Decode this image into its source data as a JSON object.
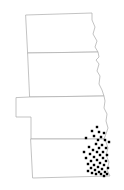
{
  "figure": {
    "type": "point-distribution-map",
    "background_color": "#ffffff",
    "width": 124,
    "height": 190
  },
  "map": {
    "outline_color": "#a9a9a9",
    "outline_width": 0.7,
    "fill_color": "#ffffff",
    "states": [
      {
        "name": "north-dakota",
        "label": "North Dakota",
        "path": "M26,15 L92,13 L92,20 L95,27 L93,34 L97,41 L95,47 L98,52 L28,53 Z"
      },
      {
        "name": "south-dakota",
        "label": "South Dakota",
        "path": "M28,53 L98,52 L99,57 L96,60 L99,64 L97,71 L100,76 L99,84 L102,90 L104,96 L30,97 Z"
      },
      {
        "name": "nebraska",
        "label": "Nebraska",
        "path": "M30,97 L104,96 L105,101 L104,108 L107,114 L106,121 L108,128 L106,134 L104,139 L31,139 L31,117 L16,117 L16,98 Z"
      },
      {
        "name": "kansas",
        "label": "Kansas",
        "path": "M31,139 L104,139 L106,142 L108,148 L106,155 L109,162 L107,170 L110,176 L33,178 Z"
      }
    ]
  },
  "chart_data": {
    "type": "scatter",
    "xlabel": "",
    "ylabel": "",
    "marker_color": "#000000",
    "marker_shape": "square",
    "marker_size": 2.4,
    "point_count": 45,
    "grid": false,
    "legend": "none",
    "xlim": [
      0,
      124
    ],
    "ylim": [
      0,
      190
    ],
    "points": [
      {
        "x": 97,
        "y": 127
      },
      {
        "x": 92,
        "y": 131
      },
      {
        "x": 99,
        "y": 132
      },
      {
        "x": 104,
        "y": 133
      },
      {
        "x": 94,
        "y": 136
      },
      {
        "x": 101,
        "y": 137
      },
      {
        "x": 86,
        "y": 138
      },
      {
        "x": 98,
        "y": 140
      },
      {
        "x": 105,
        "y": 140
      },
      {
        "x": 109,
        "y": 142
      },
      {
        "x": 96,
        "y": 144
      },
      {
        "x": 102,
        "y": 145
      },
      {
        "x": 89,
        "y": 147
      },
      {
        "x": 99,
        "y": 148
      },
      {
        "x": 106,
        "y": 148
      },
      {
        "x": 93,
        "y": 150
      },
      {
        "x": 84,
        "y": 152
      },
      {
        "x": 97,
        "y": 152
      },
      {
        "x": 103,
        "y": 152
      },
      {
        "x": 90,
        "y": 154
      },
      {
        "x": 100,
        "y": 155
      },
      {
        "x": 107,
        "y": 155
      },
      {
        "x": 94,
        "y": 157
      },
      {
        "x": 86,
        "y": 158
      },
      {
        "x": 103,
        "y": 158
      },
      {
        "x": 97,
        "y": 160
      },
      {
        "x": 91,
        "y": 161
      },
      {
        "x": 106,
        "y": 161
      },
      {
        "x": 100,
        "y": 163
      },
      {
        "x": 88,
        "y": 164
      },
      {
        "x": 94,
        "y": 165
      },
      {
        "x": 104,
        "y": 165
      },
      {
        "x": 98,
        "y": 167
      },
      {
        "x": 91,
        "y": 168
      },
      {
        "x": 108,
        "y": 168
      },
      {
        "x": 102,
        "y": 169
      },
      {
        "x": 95,
        "y": 170
      },
      {
        "x": 88,
        "y": 171
      },
      {
        "x": 99,
        "y": 172
      },
      {
        "x": 105,
        "y": 172
      },
      {
        "x": 92,
        "y": 173
      },
      {
        "x": 96,
        "y": 174
      },
      {
        "x": 101,
        "y": 174
      },
      {
        "x": 107,
        "y": 174
      },
      {
        "x": 104,
        "y": 176
      }
    ]
  }
}
